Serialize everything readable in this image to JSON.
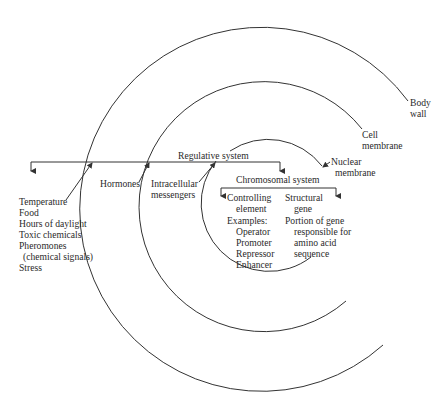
{
  "diagram": {
    "layers": [
      {
        "name": "Body wall",
        "label": "Body wall",
        "lines": [
          "Body",
          "wall"
        ]
      },
      {
        "name": "Cell membrane",
        "label": "Cell membrane",
        "lines": [
          "Cell",
          "membrane"
        ]
      },
      {
        "name": "Nuclear membrane",
        "label": "Nuclear membrane",
        "lines": [
          "Nuclear",
          "membrane"
        ]
      }
    ],
    "regulative_system": {
      "label": "Regulative system",
      "environmental_factors": [
        "Temperature",
        "Food",
        "Hours of daylight",
        "Toxic chemicals",
        "Pheromones",
        "(chemical signals)",
        "Stress"
      ],
      "hormones": "Hormones",
      "intracellular": [
        "Intracellular",
        "messengers"
      ]
    },
    "chromosomal_system": {
      "label": "Chromosomal system",
      "controlling": {
        "title": [
          "Controlling",
          "element"
        ],
        "examples_label": "Examples:",
        "examples": [
          "Operator",
          "Promoter",
          "Repressor",
          "Enhancer"
        ]
      },
      "structural": {
        "title": [
          "Structural",
          "gene"
        ],
        "description": [
          "Portion of gene",
          "responsible for",
          "amino acid",
          "sequence"
        ]
      }
    },
    "colors": {
      "line": "#333333",
      "background": "#ffffff"
    }
  }
}
